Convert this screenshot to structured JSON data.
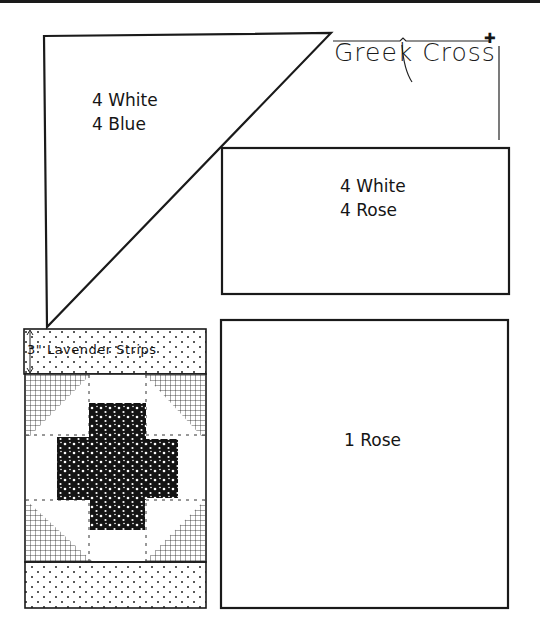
{
  "title": "Greek Cross",
  "title_mark": "✚",
  "pieces": {
    "triangle": {
      "line1": "4 White",
      "line2": "4 Blue"
    },
    "rectangle": {
      "line1": "4 White",
      "line2": "4 Rose"
    },
    "square": {
      "line1": "1 Rose"
    }
  },
  "block": {
    "strip_label": "3\" Lavender Strips",
    "colors": {
      "line": "#1a1a1a",
      "background": "#ffffff",
      "cross": "#141414"
    }
  }
}
